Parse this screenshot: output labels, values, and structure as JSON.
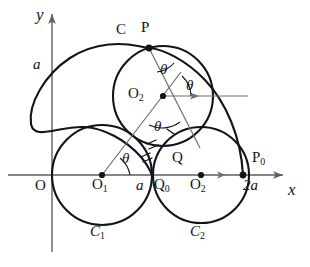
{
  "figure": {
    "axes": {
      "x_label": "x",
      "y_label": "y",
      "origin_label": "O",
      "x_axis_color": "#5a5f66",
      "y_axis_color": "#5a5f66"
    },
    "curve_color": "#111418",
    "guide_color": "#6a6f76",
    "labels": [
      {
        "name": "y-axis-label",
        "text": "y",
        "x": 36,
        "y": 6,
        "size": 17,
        "italic": true
      },
      {
        "name": "x-axis-label",
        "text": "x",
        "x": 288,
        "y": 181,
        "size": 17,
        "italic": true
      },
      {
        "name": "origin-label",
        "text": "O",
        "x": 35,
        "y": 178,
        "size": 15,
        "italic": false
      },
      {
        "name": "radius-a-label",
        "text": "a",
        "x": 33,
        "y": 57,
        "size": 15,
        "italic": true
      },
      {
        "name": "point-c-label",
        "text": "C",
        "x": 116,
        "y": 22,
        "size": 15,
        "italic": false
      },
      {
        "name": "point-p-label",
        "text": "P",
        "x": 141,
        "y": 20,
        "size": 15,
        "italic": false
      },
      {
        "name": "point-q-label",
        "text": "Q",
        "x": 172,
        "y": 150,
        "size": 15,
        "italic": false
      },
      {
        "name": "segment-a-label",
        "text": "a",
        "x": 136,
        "y": 178,
        "size": 15,
        "italic": true
      },
      {
        "name": "distance-2a-label",
        "text": "2a",
        "x": 243,
        "y": 178,
        "size": 15,
        "italic": true
      }
    ],
    "subscript_labels": [
      {
        "name": "center-o1-label",
        "text": "O",
        "sub": "1",
        "x": 92,
        "y": 177,
        "size": 15
      },
      {
        "name": "center-o2-upper-label",
        "text": "O",
        "sub": "2",
        "x": 128,
        "y": 86,
        "size": 15
      },
      {
        "name": "center-o2-lower-label",
        "text": "O",
        "sub": "2",
        "x": 190,
        "y": 177,
        "size": 15
      },
      {
        "name": "point-q0-label",
        "text": "Q",
        "sub": "0",
        "x": 154,
        "y": 177,
        "size": 15
      },
      {
        "name": "point-p0-label",
        "text": "P",
        "sub": "0",
        "x": 252,
        "y": 150,
        "size": 15
      },
      {
        "name": "circle-c1-label",
        "text": "C",
        "sub": "1",
        "x": 90,
        "y": 224,
        "size": 15,
        "italic": true
      },
      {
        "name": "circle-c2-label",
        "text": "C",
        "sub": "2",
        "x": 190,
        "y": 224,
        "size": 15,
        "italic": true
      }
    ],
    "theta_labels": [
      {
        "name": "theta-at-o1",
        "text": "θ",
        "x": 122,
        "y": 151,
        "size": 15
      },
      {
        "name": "theta-at-p",
        "text": "θ",
        "x": 160,
        "y": 62,
        "size": 15
      },
      {
        "name": "theta-at-o2-right",
        "text": "θ",
        "x": 186,
        "y": 78,
        "size": 15
      },
      {
        "name": "theta-at-o2-lower",
        "text": "θ",
        "x": 154,
        "y": 119,
        "size": 15
      }
    ]
  },
  "chart_data": {
    "type": "diagram",
    "parameters": {
      "a": 1,
      "scale_px_per_a": 50
    },
    "points": [
      {
        "label": "O",
        "px": [
          52,
          175
        ],
        "math": [
          0,
          0
        ],
        "marker": false
      },
      {
        "label": "O1",
        "px": [
          102,
          175
        ],
        "math": [
          1,
          0
        ],
        "marker": true
      },
      {
        "label": "Q0",
        "px": [
          152,
          175
        ],
        "math": [
          2,
          0
        ],
        "marker": false
      },
      {
        "label": "O2",
        "px": [
          201,
          175
        ],
        "math": [
          3,
          0
        ],
        "marker": true
      },
      {
        "label": "P0",
        "px": [
          243,
          175
        ],
        "math": [
          4,
          0
        ],
        "marker": true
      },
      {
        "label": "P",
        "px": [
          149,
          48
        ],
        "math": [
          1.95,
          2.55
        ],
        "marker": true
      },
      {
        "label": "O2u",
        "px": [
          163,
          96
        ],
        "math": [
          2.22,
          1.6
        ],
        "marker": true
      }
    ],
    "circles": [
      {
        "label": "C1",
        "center_px": [
          102,
          175
        ],
        "r_px": 50
      },
      {
        "label": "C2",
        "center_px": [
          201,
          175
        ],
        "r_px": 48
      },
      {
        "label": "C2r",
        "center_px": [
          163,
          96
        ],
        "r_px": 50
      }
    ],
    "cardioid": {
      "cusp_px": [
        152,
        175
      ],
      "a_px": 50,
      "label": "C"
    },
    "angle_label": "θ"
  }
}
